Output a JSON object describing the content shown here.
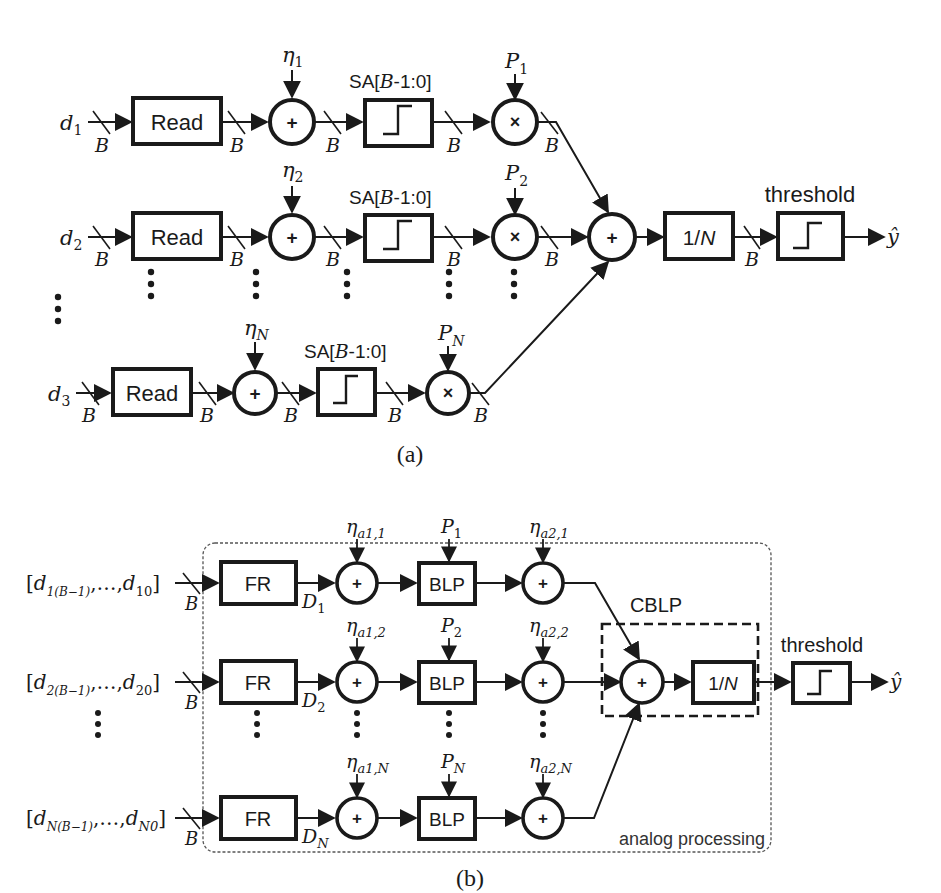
{
  "figure_a": {
    "caption": "(a)",
    "bus_width_label": "B",
    "rows": [
      {
        "input": "d",
        "input_sub": "1",
        "read_label": "Read",
        "noise": "η",
        "noise_sub": "1",
        "sa_label_prefix": "SA[",
        "sa_label_var": "B",
        "sa_label_suffix": "-1:0]",
        "weight": "P",
        "weight_sub": "1"
      },
      {
        "input": "d",
        "input_sub": "2",
        "read_label": "Read",
        "noise": "η",
        "noise_sub": "2",
        "sa_label_prefix": "SA[",
        "sa_label_var": "B",
        "sa_label_suffix": "-1:0]",
        "weight": "P",
        "weight_sub": "2"
      },
      {
        "input": "d",
        "input_sub": "3",
        "read_label": "Read",
        "noise": "η",
        "noise_sub": "N",
        "sa_label_prefix": "SA[",
        "sa_label_var": "B",
        "sa_label_suffix": "-1:0]",
        "weight": "P",
        "weight_sub": "N"
      }
    ],
    "adder_symbol": "+",
    "multiplier_symbol": "×",
    "sum_symbol": "+",
    "average_label_prefix": "1/",
    "average_label_var": "N",
    "threshold_label": "threshold",
    "output_label": "ŷ"
  },
  "figure_b": {
    "caption": "(b)",
    "bus_width_label": "B",
    "rows": [
      {
        "input_open": "[",
        "input_var": "d",
        "input_sub_first": "1(B−1)",
        "input_mid": ",…,",
        "input_sub_last": "10",
        "input_close": "]",
        "fr_label": "FR",
        "fr_out": "D",
        "fr_out_sub": "1",
        "noise1": "η",
        "noise1_sub": "a1,1",
        "blp_label": "BLP",
        "weight": "P",
        "weight_sub": "1",
        "noise2": "η",
        "noise2_sub": "a2,1"
      },
      {
        "input_open": "[",
        "input_var": "d",
        "input_sub_first": "2(B−1)",
        "input_mid": ",…,",
        "input_sub_last": "20",
        "input_close": "]",
        "fr_label": "FR",
        "fr_out": "D",
        "fr_out_sub": "2",
        "noise1": "η",
        "noise1_sub": "a1,2",
        "blp_label": "BLP",
        "weight": "P",
        "weight_sub": "2",
        "noise2": "η",
        "noise2_sub": "a2,2"
      },
      {
        "input_open": "[",
        "input_var": "d",
        "input_sub_first": "N(B−1)",
        "input_mid": ",…,",
        "input_sub_last": "N0",
        "input_close": "]",
        "fr_label": "FR",
        "fr_out": "D",
        "fr_out_sub": "N",
        "noise1": "η",
        "noise1_sub": "a1,N",
        "blp_label": "BLP",
        "weight": "P",
        "weight_sub": "N",
        "noise2": "η",
        "noise2_sub": "a2,N"
      }
    ],
    "adder_symbol": "+",
    "cblp_label": "CBLP",
    "average_label_prefix": "1/",
    "average_label_var": "N",
    "threshold_label": "threshold",
    "output_label": "ŷ",
    "analog_region_label": "analog processing"
  },
  "colors": {
    "stroke": "#1a1a1a",
    "background": "#ffffff",
    "dashed_region": "#555555"
  }
}
